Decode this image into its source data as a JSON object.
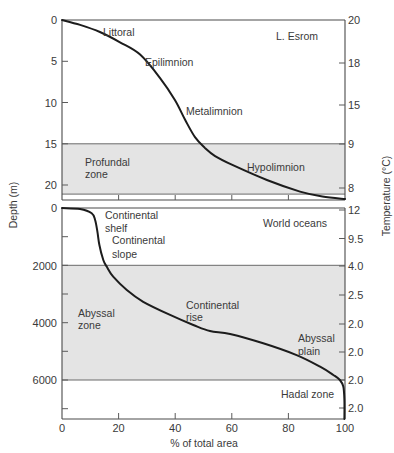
{
  "axes": {
    "xlabel": "% of total area",
    "ylabel": "Depth (m)",
    "y2label": "Temperature (°C)",
    "xticks": [
      "0",
      "20",
      "40",
      "60",
      "80",
      "100"
    ]
  },
  "chart_data": [
    {
      "panel": "upper",
      "type": "line",
      "title": "L. Esrom",
      "xlabel": "% of total area",
      "ylabel": "Depth (m)",
      "y2label": "Temperature (°C)",
      "xlim": [
        0,
        100
      ],
      "ylim": [
        0,
        21.8
      ],
      "y_inverted": true,
      "grid": false,
      "yticks": [
        "0",
        "5",
        "10",
        "15",
        "20"
      ],
      "y2ticks": [
        "20",
        "18",
        "15",
        "9",
        "8"
      ],
      "xticks": [
        20,
        40,
        60,
        80
      ],
      "shaded_band": {
        "from": 15,
        "to": 21.1,
        "label": "Profundal zone"
      },
      "series": [
        {
          "name": "Hypsographic curve (L. Esrom)",
          "points": [
            [
              0,
              0
            ],
            [
              6.4,
              0.6
            ],
            [
              13.4,
              1.45
            ],
            [
              20.5,
              2.7
            ],
            [
              27.6,
              4.2
            ],
            [
              34.6,
              7.0
            ],
            [
              39.9,
              9.7
            ],
            [
              43.5,
              12.1
            ],
            [
              47.0,
              14.2
            ],
            [
              50.5,
              15.5
            ],
            [
              54.1,
              16.5
            ],
            [
              60.4,
              17.6
            ],
            [
              72.4,
              19.4
            ],
            [
              84.1,
              20.8
            ],
            [
              92.0,
              21.4
            ],
            [
              100,
              21.7
            ]
          ]
        }
      ],
      "annotations": [
        {
          "text": "Littoral",
          "lines": [
            "Littoral"
          ]
        },
        {
          "text": "Epilimnion",
          "lines": [
            "Epilimnion"
          ]
        },
        {
          "text": "Metalimnion",
          "lines": [
            "Metalimnion"
          ]
        },
        {
          "text": "L. Esrom",
          "lines": [
            "L. Esrom"
          ]
        },
        {
          "text": "Profundal zone",
          "lines": [
            "Profundal",
            "zone"
          ]
        },
        {
          "text": "Hypolimnion",
          "lines": [
            "Hypolimnion"
          ]
        }
      ]
    },
    {
      "panel": "lower",
      "type": "line",
      "title": "World oceans",
      "xlabel": "% of total area",
      "ylabel": "Depth (m)",
      "y2label": "Temperature (°C)",
      "xlim": [
        0,
        100
      ],
      "ylim": [
        0,
        7360
      ],
      "y_inverted": true,
      "grid": false,
      "yticks": [
        "0",
        "2000",
        "4000",
        "6000"
      ],
      "y2ticks": [
        "12",
        "9.5",
        "4.0",
        "2.5",
        "2.0",
        "2.0",
        "2.0",
        "2.0"
      ],
      "xticks": [
        "0",
        "20",
        "40",
        "60",
        "80",
        "100"
      ],
      "shaded_band": {
        "from": 2000,
        "to": 6000,
        "label": "Abyssal zone"
      },
      "series": [
        {
          "name": "Hypsographic curve (World oceans)",
          "points": [
            [
              0,
              0
            ],
            [
              6.4,
              35
            ],
            [
              10.5,
              185
            ],
            [
              11.7,
              420
            ],
            [
              12.5,
              825
            ],
            [
              13.2,
              1290
            ],
            [
              14.6,
              1815
            ],
            [
              15.8,
              2045
            ],
            [
              18.1,
              2395
            ],
            [
              22.9,
              2860
            ],
            [
              28.7,
              3270
            ],
            [
              38.2,
              3730
            ],
            [
              46.4,
              4080
            ],
            [
              52.3,
              4290
            ],
            [
              59.4,
              4395
            ],
            [
              71.1,
              4720
            ],
            [
              82.9,
              5130
            ],
            [
              91.2,
              5535
            ],
            [
              95.9,
              5825
            ],
            [
              98.2,
              6000
            ],
            [
              99.4,
              6230
            ],
            [
              99.8,
              6700
            ],
            [
              99.8,
              7360
            ]
          ]
        }
      ],
      "annotations": [
        {
          "text": "Continental shelf",
          "lines": [
            "Continental",
            "shelf"
          ]
        },
        {
          "text": "Continental slope",
          "lines": [
            "Continental",
            "slope"
          ]
        },
        {
          "text": "World oceans",
          "lines": [
            "World oceans"
          ]
        },
        {
          "text": "Abyssal zone",
          "lines": [
            "Abyssal",
            "zone"
          ]
        },
        {
          "text": "Continental rise",
          "lines": [
            "Continental",
            "rise"
          ]
        },
        {
          "text": "Abyssal plain",
          "lines": [
            "Abyssal",
            "plain"
          ]
        },
        {
          "text": "Hadal zone",
          "lines": [
            "Hadal zone"
          ]
        }
      ]
    }
  ]
}
